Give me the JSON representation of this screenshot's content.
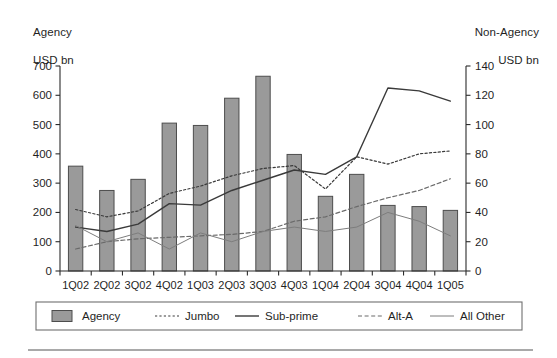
{
  "figure": {
    "left_axis_title_line1": "Agency",
    "left_axis_title_line2": "USD bn",
    "right_axis_title_line1": "Non-Agency",
    "right_axis_title_line2": "USD bn"
  },
  "chart_data": {
    "type": "bar",
    "title": "",
    "xlabel": "",
    "ylabel": "Agency USD bn",
    "y2label": "Non-Agency USD bn",
    "grid": false,
    "legend_position": "bottom",
    "ylim": [
      0,
      700
    ],
    "y2lim": [
      0,
      140
    ],
    "yticks": [
      0,
      100,
      200,
      300,
      400,
      500,
      600,
      700
    ],
    "y2ticks": [
      0,
      20,
      40,
      60,
      80,
      100,
      120,
      140
    ],
    "categories": [
      "1Q02",
      "2Q02",
      "3Q02",
      "4Q02",
      "1Q03",
      "2Q03",
      "3Q03",
      "4Q03",
      "1Q04",
      "2Q04",
      "3Q04",
      "4Q04",
      "1Q05"
    ],
    "series": [
      {
        "name": "Agency",
        "kind": "bar",
        "axis": "left",
        "color": "#9a9a9a",
        "edge_color": "#4d4d4d",
        "values": [
          358,
          275,
          313,
          505,
          497,
          590,
          665,
          398,
          255,
          330,
          224,
          220,
          207
        ]
      },
      {
        "name": "Jumbo",
        "kind": "line",
        "style": "dotted",
        "axis": "right",
        "color": "#3a3a3a",
        "values": [
          42,
          37,
          41,
          53,
          58,
          65,
          70,
          72,
          56,
          78,
          73,
          80,
          82
        ]
      },
      {
        "name": "Sub-prime",
        "kind": "line",
        "style": "solid",
        "axis": "right",
        "color": "#3a3a3a",
        "values": [
          30,
          27,
          32,
          46,
          45,
          55,
          62,
          69,
          66,
          78,
          125,
          123,
          116
        ]
      },
      {
        "name": "Alt-A",
        "kind": "line",
        "style": "dashed",
        "axis": "right",
        "color": "#6a6a6a",
        "values": [
          15,
          20,
          22,
          23,
          24,
          25,
          27,
          34,
          37,
          44,
          50,
          55,
          63
        ]
      },
      {
        "name": "All Other",
        "kind": "line",
        "style": "solid-thin",
        "axis": "right",
        "color": "#7d7d7d",
        "values": [
          31,
          20,
          26,
          15,
          26,
          20,
          27,
          30,
          27,
          30,
          40,
          34,
          24
        ]
      }
    ],
    "legend": [
      {
        "label": "Agency",
        "marker": "bar-swatch"
      },
      {
        "label": "Jumbo",
        "marker": "dotted-line"
      },
      {
        "label": "Sub-prime",
        "marker": "solid-line"
      },
      {
        "label": "Alt-A",
        "marker": "dashed-line"
      },
      {
        "label": "All Other",
        "marker": "thin-solid-line"
      }
    ]
  }
}
